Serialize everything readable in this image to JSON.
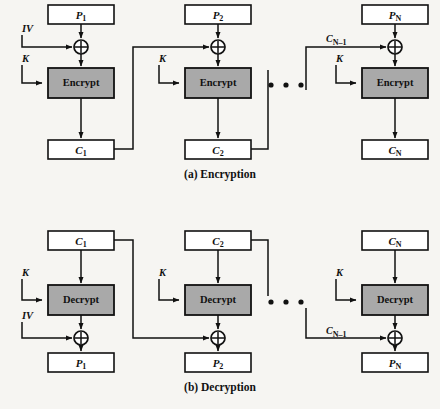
{
  "figure": {
    "background_color": "#f6f5f2",
    "line_color": "#111111",
    "cipher_fill_color": "#a9a9a9",
    "block_fill_color": "#ffffff"
  },
  "captions": {
    "encryption": "(a) Encryption",
    "decryption": "(b) Decryption"
  },
  "ellipsis": {
    "glyph": "•",
    "count": 3
  },
  "encryption": {
    "caption": "(a) Encryption",
    "stages": [
      {
        "index": 1,
        "plaintext_label": "P",
        "plaintext_sub": "1",
        "key_label": "K",
        "iv_label": "IV",
        "cipher_op_label": "Encrypt",
        "xor_label": "⊕",
        "output_label": "C",
        "output_sub": "1",
        "feed_in_label": "IV"
      },
      {
        "index": 2,
        "plaintext_label": "P",
        "plaintext_sub": "2",
        "key_label": "K",
        "cipher_op_label": "Encrypt",
        "xor_label": "⊕",
        "output_label": "C",
        "output_sub": "2",
        "feed_in_label": ""
      },
      {
        "index": 3,
        "plaintext_label": "P",
        "plaintext_sub": "N",
        "key_label": "K",
        "cipher_op_label": "Encrypt",
        "xor_label": "⊕",
        "output_label": "C",
        "output_sub": "N",
        "feed_in_label": "C",
        "feed_in_sub": "N–1"
      }
    ]
  },
  "decryption": {
    "caption": "(b) Decryption",
    "stages": [
      {
        "index": 1,
        "ciphertext_label": "C",
        "ciphertext_sub": "1",
        "key_label": "K",
        "iv_label": "IV",
        "cipher_op_label": "Decrypt",
        "xor_label": "⊕",
        "output_label": "P",
        "output_sub": "1",
        "feed_in_label": "IV"
      },
      {
        "index": 2,
        "ciphertext_label": "C",
        "ciphertext_sub": "2",
        "key_label": "K",
        "cipher_op_label": "Decrypt",
        "xor_label": "⊕",
        "output_label": "P",
        "output_sub": "2",
        "feed_in_label": ""
      },
      {
        "index": 3,
        "ciphertext_label": "C",
        "ciphertext_sub": "N",
        "key_label": "K",
        "cipher_op_label": "Decrypt",
        "xor_label": "⊕",
        "output_label": "P",
        "output_sub": "N",
        "feed_in_label": "C",
        "feed_in_sub": "N–1"
      }
    ]
  }
}
